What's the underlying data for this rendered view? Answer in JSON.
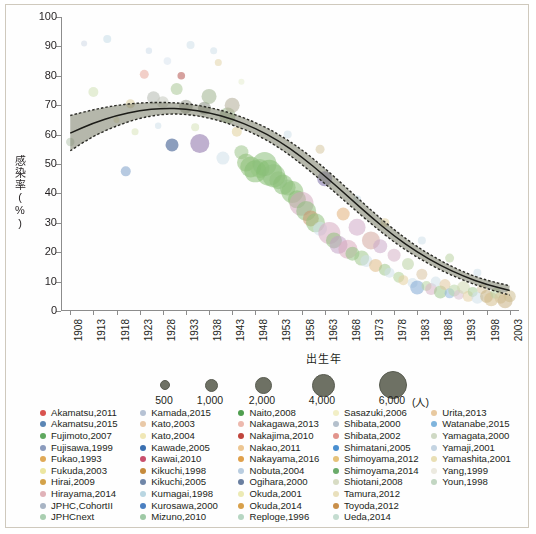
{
  "chart_data": {
    "type": "scatter",
    "title": "",
    "xlabel": "出生年",
    "ylabel": "感染率(%)",
    "xlim": [
      1906,
      2005
    ],
    "ylim": [
      0,
      100
    ],
    "grid": false,
    "x_ticks": [
      "1908",
      "1913",
      "1918",
      "1923",
      "1928",
      "1933",
      "1938",
      "1943",
      "1948",
      "1953",
      "1958",
      "1963",
      "1968",
      "1973",
      "1978",
      "1983",
      "1988",
      "1993",
      "1998",
      "2003"
    ],
    "y_ticks": [
      "0",
      "10",
      "20",
      "30",
      "40",
      "50",
      "60",
      "70",
      "80",
      "90",
      "100"
    ],
    "bubble_size_legend": {
      "unit": "(人)",
      "values": [
        "500",
        "1,000",
        "2,000",
        "4,000",
        "6,000"
      ]
    },
    "fitted_curve": {
      "description": "fitted trend with dashed confidence band",
      "x": [
        1908,
        1913,
        1918,
        1923,
        1928,
        1933,
        1938,
        1943,
        1948,
        1953,
        1958,
        1963,
        1968,
        1973,
        1978,
        1983,
        1988,
        1993,
        1998,
        2003
      ],
      "y": [
        60.5,
        64.0,
        66.5,
        68.2,
        69.0,
        68.8,
        67.5,
        65.3,
        62.2,
        58.0,
        52.5,
        46.0,
        39.0,
        32.0,
        25.5,
        20.0,
        15.5,
        11.8,
        9.0,
        7.0
      ],
      "ci_upper": [
        66.5,
        68.5,
        70.0,
        70.8,
        71.0,
        70.6,
        69.3,
        67.2,
        64.2,
        60.2,
        55.0,
        48.6,
        41.5,
        34.3,
        27.6,
        21.8,
        17.1,
        13.2,
        10.4,
        8.6
      ],
      "ci_lower": [
        54.5,
        59.5,
        63.0,
        65.6,
        67.0,
        67.0,
        65.7,
        63.4,
        60.2,
        55.8,
        50.0,
        43.4,
        36.5,
        29.7,
        23.4,
        18.2,
        13.9,
        10.4,
        7.6,
        5.4
      ]
    },
    "points": [
      {
        "x": 1908,
        "y": 57.5,
        "r": 4.2,
        "c": "#b7c6b0"
      },
      {
        "x": 1911,
        "y": 91.0,
        "r": 3.0,
        "c": "#cfd9e6"
      },
      {
        "x": 1913,
        "y": 74.5,
        "r": 5.0,
        "c": "#cfe0b4"
      },
      {
        "x": 1916,
        "y": 92.5,
        "r": 4.0,
        "c": "#c7dde8"
      },
      {
        "x": 1920,
        "y": 47.5,
        "r": 5.0,
        "c": "#7b9ec9"
      },
      {
        "x": 1921,
        "y": 70.5,
        "r": 4.5,
        "c": "#d8cc9a"
      },
      {
        "x": 1922,
        "y": 61.0,
        "r": 3.5,
        "c": "#d9e3ba"
      },
      {
        "x": 1924,
        "y": 80.5,
        "r": 4.5,
        "c": "#e8a89a"
      },
      {
        "x": 1925,
        "y": 88.5,
        "r": 3.2,
        "c": "#cddcea"
      },
      {
        "x": 1926,
        "y": 72.5,
        "r": 6.5,
        "c": "#b3b8ae"
      },
      {
        "x": 1928,
        "y": 71.0,
        "r": 6.0,
        "c": "#c4c8bd"
      },
      {
        "x": 1929,
        "y": 85.0,
        "r": 3.8,
        "c": "#d9e4ee"
      },
      {
        "x": 1930,
        "y": 56.5,
        "r": 6.5,
        "c": "#2e4f86"
      },
      {
        "x": 1931,
        "y": 75.5,
        "r": 6.0,
        "c": "#a9c796"
      },
      {
        "x": 1932,
        "y": 80.0,
        "r": 3.8,
        "c": "#b4544e"
      },
      {
        "x": 1933,
        "y": 69.5,
        "r": 6.8,
        "c": "#8f9487"
      },
      {
        "x": 1934,
        "y": 90.5,
        "r": 4.0,
        "c": "#cfe0ea"
      },
      {
        "x": 1935,
        "y": 62.5,
        "r": 4.0,
        "c": "#d5e2b8"
      },
      {
        "x": 1936,
        "y": 57.0,
        "r": 9.5,
        "c": "#8a6fa8"
      },
      {
        "x": 1937,
        "y": 69.0,
        "r": 6.5,
        "c": "#889081"
      },
      {
        "x": 1938,
        "y": 73.0,
        "r": 7.5,
        "c": "#9fb28e"
      },
      {
        "x": 1939,
        "y": 88.5,
        "r": 3.5,
        "c": "#cfe0ea"
      },
      {
        "x": 1940,
        "y": 84.5,
        "r": 3.5,
        "c": "#e2d3a8"
      },
      {
        "x": 1941,
        "y": 52.0,
        "r": 6.5,
        "c": "#cfe0ea"
      },
      {
        "x": 1942,
        "y": 66.5,
        "r": 8.0,
        "c": "#9ab68b"
      },
      {
        "x": 1943,
        "y": 70.0,
        "r": 7.5,
        "c": "#b0ab95"
      },
      {
        "x": 1944,
        "y": 61.0,
        "r": 5.0,
        "c": "#e0d09b"
      },
      {
        "x": 1945,
        "y": 54.0,
        "r": 7.0,
        "c": "#9dc48a"
      },
      {
        "x": 1946,
        "y": 50.5,
        "r": 9.0,
        "c": "#8fbf79"
      },
      {
        "x": 1947,
        "y": 49.0,
        "r": 10.5,
        "c": "#8cc077"
      },
      {
        "x": 1948,
        "y": 47.5,
        "r": 11.0,
        "c": "#86bd72"
      },
      {
        "x": 1949,
        "y": 48.5,
        "r": 9.5,
        "c": "#93c480"
      },
      {
        "x": 1950,
        "y": 50.0,
        "r": 12.0,
        "c": "#8bc07a"
      },
      {
        "x": 1951,
        "y": 47.0,
        "r": 13.0,
        "c": "#84bd70"
      },
      {
        "x": 1952,
        "y": 46.0,
        "r": 11.5,
        "c": "#8dbf7c"
      },
      {
        "x": 1953,
        "y": 44.5,
        "r": 9.0,
        "c": "#90c17e"
      },
      {
        "x": 1954,
        "y": 43.0,
        "r": 10.0,
        "c": "#89bd76"
      },
      {
        "x": 1955,
        "y": 42.0,
        "r": 8.0,
        "c": "#94c383"
      },
      {
        "x": 1956,
        "y": 40.5,
        "r": 11.0,
        "c": "#8cbf79"
      },
      {
        "x": 1957,
        "y": 38.0,
        "r": 9.0,
        "c": "#86bb73"
      },
      {
        "x": 1958,
        "y": 36.5,
        "r": 12.0,
        "c": "#d2a8bb"
      },
      {
        "x": 1959,
        "y": 34.0,
        "r": 10.0,
        "c": "#8dbe7b"
      },
      {
        "x": 1960,
        "y": 31.5,
        "r": 8.0,
        "c": "#c9956c"
      },
      {
        "x": 1961,
        "y": 30.0,
        "r": 9.5,
        "c": "#8fc17e"
      },
      {
        "x": 1962,
        "y": 28.0,
        "r": 7.0,
        "c": "#cfe0ea"
      },
      {
        "x": 1963,
        "y": 45.0,
        "r": 7.5,
        "c": "#7b6fa8"
      },
      {
        "x": 1964,
        "y": 26.5,
        "r": 11.0,
        "c": "#d6aabf"
      },
      {
        "x": 1965,
        "y": 24.0,
        "r": 8.0,
        "c": "#8fc07c"
      },
      {
        "x": 1966,
        "y": 22.5,
        "r": 9.0,
        "c": "#c1a0c4"
      },
      {
        "x": 1967,
        "y": 33.0,
        "r": 6.5,
        "c": "#e2b07a"
      },
      {
        "x": 1968,
        "y": 21.0,
        "r": 9.5,
        "c": "#d8a9bb"
      },
      {
        "x": 1969,
        "y": 19.5,
        "r": 7.0,
        "c": "#93c281"
      },
      {
        "x": 1970,
        "y": 28.5,
        "r": 8.5,
        "c": "#cfa9c7"
      },
      {
        "x": 1971,
        "y": 18.0,
        "r": 7.5,
        "c": "#9ec78a"
      },
      {
        "x": 1972,
        "y": 17.0,
        "r": 6.0,
        "c": "#cfe0ea"
      },
      {
        "x": 1973,
        "y": 24.0,
        "r": 9.0,
        "c": "#d4a79e"
      },
      {
        "x": 1974,
        "y": 15.5,
        "r": 6.5,
        "c": "#dfb985"
      },
      {
        "x": 1975,
        "y": 22.0,
        "r": 7.0,
        "c": "#caa9c9"
      },
      {
        "x": 1976,
        "y": 14.0,
        "r": 6.0,
        "c": "#9ec78a"
      },
      {
        "x": 1977,
        "y": 13.0,
        "r": 5.0,
        "c": "#cfe0ea"
      },
      {
        "x": 1978,
        "y": 19.0,
        "r": 6.5,
        "c": "#d5b2c6"
      },
      {
        "x": 1979,
        "y": 11.5,
        "r": 5.5,
        "c": "#aecf96"
      },
      {
        "x": 1980,
        "y": 10.5,
        "r": 5.0,
        "c": "#e3d09e"
      },
      {
        "x": 1981,
        "y": 16.0,
        "r": 6.0,
        "c": "#b9d2a2"
      },
      {
        "x": 1982,
        "y": 9.5,
        "r": 5.0,
        "c": "#cfe0ea"
      },
      {
        "x": 1983,
        "y": 8.0,
        "r": 7.0,
        "c": "#7fa8d4"
      },
      {
        "x": 1984,
        "y": 12.5,
        "r": 5.5,
        "c": "#d9c3a0"
      },
      {
        "x": 1985,
        "y": 8.5,
        "r": 5.0,
        "c": "#b6d4a0"
      },
      {
        "x": 1986,
        "y": 7.5,
        "r": 6.0,
        "c": "#d7b3c5"
      },
      {
        "x": 1987,
        "y": 10.0,
        "r": 5.0,
        "c": "#cfe0ea"
      },
      {
        "x": 1988,
        "y": 6.5,
        "r": 6.5,
        "c": "#9cc78c"
      },
      {
        "x": 1989,
        "y": 9.0,
        "r": 5.5,
        "c": "#e0c79c"
      },
      {
        "x": 1990,
        "y": 6.0,
        "r": 5.0,
        "c": "#8fb7dd"
      },
      {
        "x": 1991,
        "y": 7.0,
        "r": 6.0,
        "c": "#b9d6a6"
      },
      {
        "x": 1992,
        "y": 5.5,
        "r": 5.0,
        "c": "#d9bfd0"
      },
      {
        "x": 1993,
        "y": 8.0,
        "r": 6.5,
        "c": "#cfd9b0"
      },
      {
        "x": 1994,
        "y": 5.0,
        "r": 5.5,
        "c": "#e3cfa4"
      },
      {
        "x": 1995,
        "y": 6.5,
        "r": 5.0,
        "c": "#a9cf9a"
      },
      {
        "x": 1996,
        "y": 4.5,
        "r": 6.0,
        "c": "#cfe0ea"
      },
      {
        "x": 1997,
        "y": 7.5,
        "r": 5.0,
        "c": "#d9c9a4"
      },
      {
        "x": 1998,
        "y": 5.0,
        "r": 6.5,
        "c": "#c6b07f"
      },
      {
        "x": 1999,
        "y": 4.0,
        "r": 7.0,
        "c": "#d4bd8c"
      },
      {
        "x": 2000,
        "y": 6.0,
        "r": 5.5,
        "c": "#bcd3a4"
      },
      {
        "x": 2001,
        "y": 4.5,
        "r": 6.0,
        "c": "#d8c79c"
      },
      {
        "x": 2002,
        "y": 3.5,
        "r": 7.5,
        "c": "#c9b184"
      },
      {
        "x": 2003,
        "y": 5.0,
        "r": 6.0,
        "c": "#cdbd90"
      },
      {
        "x": 1918,
        "y": 65.0,
        "r": 3.0,
        "c": "#e8e0b0"
      },
      {
        "x": 1927,
        "y": 63.0,
        "r": 3.2,
        "c": "#cfe0ea"
      },
      {
        "x": 1945,
        "y": 78.0,
        "r": 3.0,
        "c": "#e6eccf"
      },
      {
        "x": 1955,
        "y": 60.0,
        "r": 4.0,
        "c": "#cfe0ea"
      },
      {
        "x": 1962,
        "y": 55.0,
        "r": 4.5,
        "c": "#d5c6a0"
      },
      {
        "x": 1970,
        "y": 38.0,
        "r": 4.0,
        "c": "#cfe0ea"
      },
      {
        "x": 1976,
        "y": 30.0,
        "r": 4.5,
        "c": "#e0cfa0"
      },
      {
        "x": 1984,
        "y": 24.0,
        "r": 4.0,
        "c": "#cfe0ea"
      },
      {
        "x": 1990,
        "y": 18.0,
        "r": 4.5,
        "c": "#b9d2a2"
      },
      {
        "x": 1996,
        "y": 13.0,
        "r": 4.0,
        "c": "#cfe0ea"
      }
    ]
  },
  "axis": {
    "y_title": "感染率(%)",
    "x_title": "出生年"
  },
  "size_legend": {
    "unit_label": "(人)",
    "items": [
      {
        "label": "500",
        "radius": 4.0
      },
      {
        "label": "1,000",
        "radius": 5.5
      },
      {
        "label": "2,000",
        "radius": 7.5
      },
      {
        "label": "4,000",
        "radius": 10.5
      },
      {
        "label": "6,000",
        "radius": 13.0
      }
    ]
  },
  "study_legend": {
    "columns": [
      [
        {
          "label": "Akamatsu,2011",
          "color": "#d9534f"
        },
        {
          "label": "Akamatsu,2015",
          "color": "#5b86b5"
        },
        {
          "label": "Fujimoto,2007",
          "color": "#5fa85f"
        },
        {
          "label": "Fujisawa,1999",
          "color": "#8b9bbd"
        },
        {
          "label": "Fukao,1993",
          "color": "#e0a957"
        },
        {
          "label": "Fukuda,2003",
          "color": "#ece6a0"
        },
        {
          "label": "Hirai,2009",
          "color": "#d3a24a"
        },
        {
          "label": "Hirayama,2014",
          "color": "#e0b2b8"
        },
        {
          "label": "JPHC,CohortII",
          "color": "#a8b4c4"
        },
        {
          "label": "JPHCnext",
          "color": "#a9ceb0"
        }
      ],
      [
        {
          "label": "Kamada,2015",
          "color": "#b6c2d4"
        },
        {
          "label": "Kato,2003",
          "color": "#e9c9a8"
        },
        {
          "label": "Kato,2004",
          "color": "#f0e7b6"
        },
        {
          "label": "Kawade,2005",
          "color": "#3a6fb0"
        },
        {
          "label": "Kawai,2010",
          "color": "#c94f6d"
        },
        {
          "label": "Kikuchi,1998",
          "color": "#c68b3c"
        },
        {
          "label": "Kikuchi,2005",
          "color": "#6f86a8"
        },
        {
          "label": "Kumagai,1998",
          "color": "#b9d6e2"
        },
        {
          "label": "Kurosawa,2000",
          "color": "#4a7fc1"
        },
        {
          "label": "Mizuno,2010",
          "color": "#9ec9a5"
        }
      ],
      [
        {
          "label": "Naito,2008",
          "color": "#4f9e4f"
        },
        {
          "label": "Nakagawa,2013",
          "color": "#edb9ae"
        },
        {
          "label": "Nakajima,2010",
          "color": "#c0453c"
        },
        {
          "label": "Nakao,2011",
          "color": "#edc692"
        },
        {
          "label": "Nakayama,2016",
          "color": "#e0a04a"
        },
        {
          "label": "Nobuta,2004",
          "color": "#b9cde0"
        },
        {
          "label": "Ogihara,2000",
          "color": "#6a7fa0"
        },
        {
          "label": "Okuda,2001",
          "color": "#eceab4"
        },
        {
          "label": "Okuda,2014",
          "color": "#d8a04a"
        },
        {
          "label": "Reploge,1996",
          "color": "#b6d6c2"
        }
      ],
      [
        {
          "label": "Sasazuki,2006",
          "color": "#f2efc6"
        },
        {
          "label": "Shibata,2000",
          "color": "#b4c0cc"
        },
        {
          "label": "Shibata,2002",
          "color": "#e2948c"
        },
        {
          "label": "Shimatani,2005",
          "color": "#4a8fd0"
        },
        {
          "label": "Shimoyama,2012",
          "color": "#e6c27a"
        },
        {
          "label": "Shimoyama,2014",
          "color": "#6aab6a"
        },
        {
          "label": "Shiotani,2008",
          "color": "#d8dcc4"
        },
        {
          "label": "Tamura,2012",
          "color": "#e9e0bc"
        },
        {
          "label": "Toyoda,2012",
          "color": "#c98f4a"
        },
        {
          "label": "Ueda,2014",
          "color": "#c4dcd0"
        }
      ],
      [
        {
          "label": "Urita,2013",
          "color": "#e8c9a0"
        },
        {
          "label": "Watanabe,2015",
          "color": "#7fb4dc"
        },
        {
          "label": "Yamagata,2000",
          "color": "#cfd9c4"
        },
        {
          "label": "Yamaji,2001",
          "color": "#c4d4e2"
        },
        {
          "label": "Yamashita,2001",
          "color": "#e9dfb4"
        },
        {
          "label": "Yang,1999",
          "color": "#eceae0"
        },
        {
          "label": "Youn,1998",
          "color": "#c2d6c2"
        }
      ]
    ]
  }
}
